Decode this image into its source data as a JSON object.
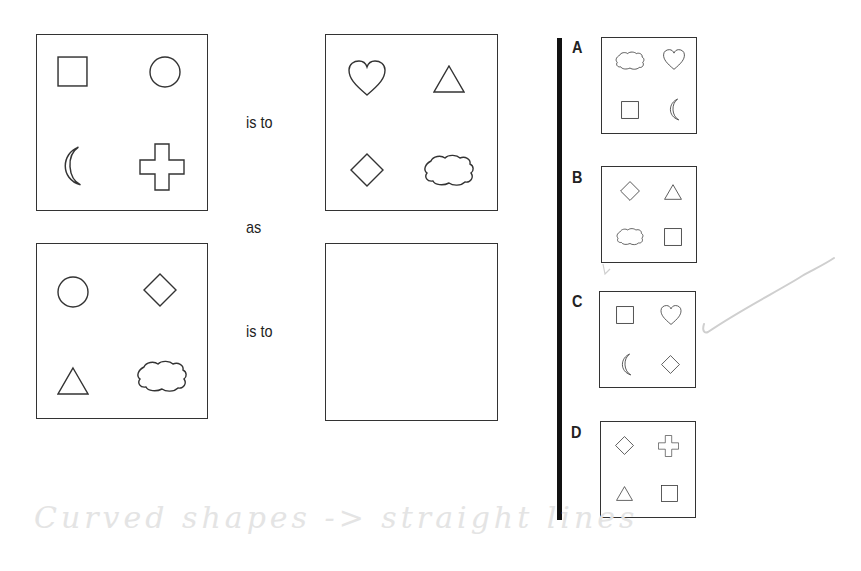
{
  "puzzle": {
    "words": {
      "is_to_1": "is to",
      "as": "as",
      "is_to_2": "is to"
    },
    "question_boxes": [
      {
        "position": "top-left",
        "shapes": [
          "square",
          "circle",
          "crescent-moon",
          "cross"
        ]
      },
      {
        "position": "top-right",
        "shapes": [
          "heart",
          "triangle",
          "diamond",
          "cloud"
        ]
      },
      {
        "position": "bottom-left",
        "shapes": [
          "circle",
          "diamond",
          "triangle",
          "cloud"
        ]
      },
      {
        "position": "bottom-right",
        "shapes": []
      }
    ],
    "options": [
      {
        "label": "A",
        "shapes": [
          "cloud",
          "heart",
          "square",
          "crescent-moon"
        ]
      },
      {
        "label": "B",
        "shapes": [
          "diamond",
          "triangle",
          "cloud",
          "square"
        ]
      },
      {
        "label": "C",
        "shapes": [
          "square",
          "heart",
          "crescent-moon",
          "diamond"
        ]
      },
      {
        "label": "D",
        "shapes": [
          "diamond",
          "cross",
          "triangle",
          "square"
        ]
      }
    ],
    "handwritten_note": "Curved shapes -> straight lines",
    "checkmark": "pencil-checkmark"
  }
}
